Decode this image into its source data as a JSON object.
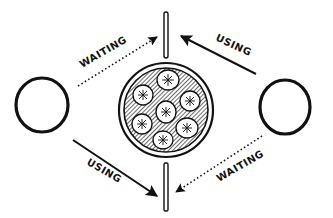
{
  "diagram": {
    "type": "dining-philosophers-deadlock",
    "colors": {
      "ink": "#111111",
      "background": "#ffffff",
      "hatch": "#555555"
    },
    "nodes": [
      {
        "id": "philosopher-left",
        "shape": "circle",
        "label": ""
      },
      {
        "id": "philosopher-right",
        "shape": "circle",
        "label": ""
      },
      {
        "id": "plate",
        "shape": "plate",
        "items": 7
      },
      {
        "id": "chopstick-top",
        "shape": "stick"
      },
      {
        "id": "chopstick-bottom",
        "shape": "stick"
      }
    ],
    "edges": [
      {
        "from": "philosopher-left",
        "to": "chopstick-top",
        "style": "dotted",
        "label": "WAITING"
      },
      {
        "from": "philosopher-right",
        "to": "chopstick-top",
        "style": "solid",
        "label": "USING"
      },
      {
        "from": "philosopher-left",
        "to": "chopstick-bottom",
        "style": "solid",
        "label": "USING"
      },
      {
        "from": "philosopher-right",
        "to": "chopstick-bottom",
        "style": "dotted",
        "label": "WAITING"
      }
    ]
  }
}
